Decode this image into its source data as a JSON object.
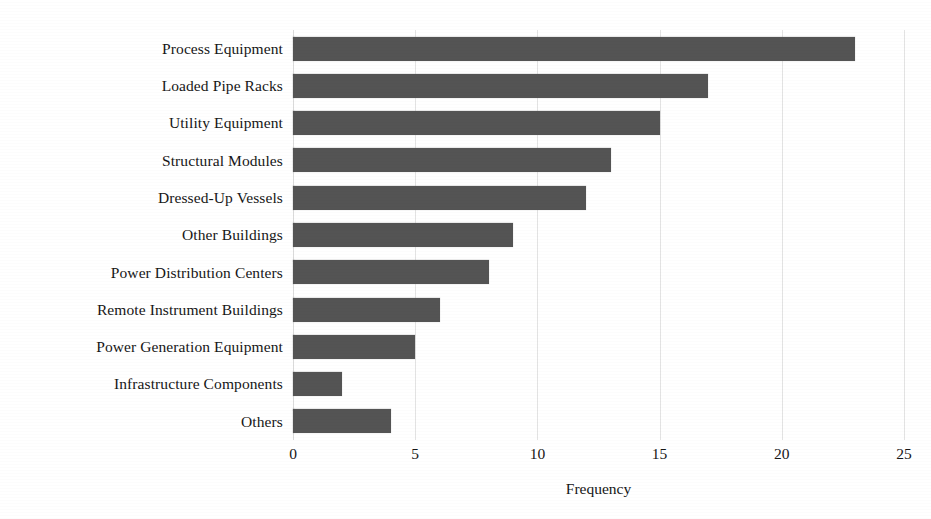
{
  "chart_data": {
    "type": "bar",
    "orientation": "horizontal",
    "title": "",
    "subtitle": "",
    "xlabel": "Frequency",
    "ylabel": "",
    "xlim": [
      0,
      25
    ],
    "xticks": [
      0,
      5,
      10,
      15,
      20,
      25
    ],
    "xtick_labels": [
      "0",
      "5",
      "10",
      "15",
      "20",
      "25"
    ],
    "grid": "vertical",
    "legend": "none",
    "bar_color": "#545454",
    "gridline_color": "#e3e3e3",
    "background_color": "#ffffff",
    "categories": [
      "Process Equipment",
      "Loaded Pipe Racks",
      "Utility Equipment",
      "Structural Modules",
      "Dressed-Up Vessels",
      "Other Buildings",
      "Power Distribution Centers",
      "Remote Instrument Buildings",
      "Power Generation Equipment",
      "Infrastructure Components",
      "Others"
    ],
    "values": [
      23,
      17,
      15,
      13,
      12,
      9,
      8,
      6,
      5,
      2,
      4
    ],
    "series": [
      {
        "name": "Frequency",
        "values": [
          23,
          17,
          15,
          13,
          12,
          9,
          8,
          6,
          5,
          2,
          4
        ]
      }
    ]
  }
}
